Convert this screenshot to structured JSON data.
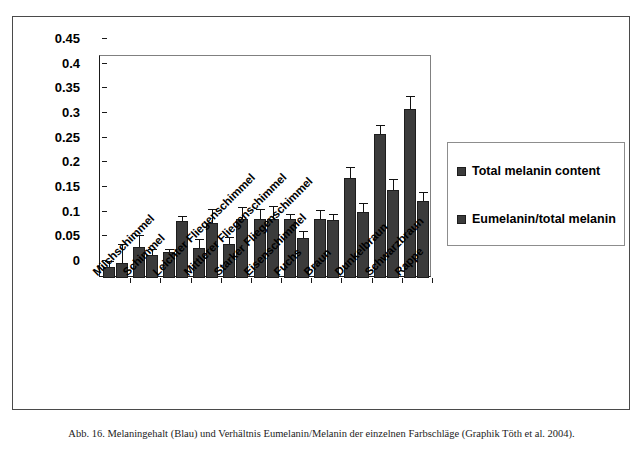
{
  "figure": {
    "caption": "Abb. 16. Melaningehalt (Blau) und Verhältnis Eumelanin/Melanin der einzelnen Farbschläge (Graphik Töth et al. 2004)."
  },
  "legend": {
    "position": "right",
    "entries": [
      {
        "label": "Total melanin content",
        "color": "#3b3b3b"
      },
      {
        "label": "Eumelanin/total melanin",
        "color": "#3b3b3b"
      }
    ]
  },
  "chart_data": {
    "type": "bar",
    "title": "",
    "xlabel": "",
    "ylabel": "",
    "ylim": [
      0,
      0.45
    ],
    "grid": false,
    "legend_position": "right",
    "yticks": [
      "0",
      "0.05",
      "0.1",
      "0.15",
      "0.2",
      "0.25",
      "0.3",
      "0.35",
      "0.4",
      "0.45"
    ],
    "ytick_values": [
      0,
      0.05,
      0.1,
      0.15,
      0.2,
      0.25,
      0.3,
      0.35,
      0.4,
      0.45
    ],
    "categories": [
      "Milchschimmel",
      "Schimmel",
      "Leichter Fliegenschimmel",
      "Mittlerer Fliegenschimmel",
      "Starker Fliegenschimmel",
      "Eisenschimmel",
      "Fuchs",
      "Braun",
      "Dunkelbraun",
      "Schwarzbraun",
      "Rappe"
    ],
    "series": [
      {
        "name": "Total melanin content",
        "color": "#3b3b3b",
        "values": [
          0.022,
          0.063,
          0.052,
          0.06,
          0.068,
          0.12,
          0.12,
          0.12,
          0.203,
          0.292,
          0.343
        ],
        "errors": [
          0.012,
          0.024,
          0.007,
          0.02,
          0.015,
          0.02,
          0.01,
          0.018,
          0.022,
          0.018,
          0.026
        ]
      },
      {
        "name": "Eumelanin/total melanin",
        "color": "#3b3b3b",
        "values": [
          0.03,
          0.046,
          0.115,
          0.112,
          0.12,
          0.12,
          0.082,
          0.117,
          0.133,
          0.178,
          0.157
        ],
        "errors": [
          0.038,
          0.013,
          0.01,
          0.027,
          0.023,
          0.025,
          0.013,
          0.013,
          0.02,
          0.022,
          0.018
        ]
      }
    ]
  }
}
